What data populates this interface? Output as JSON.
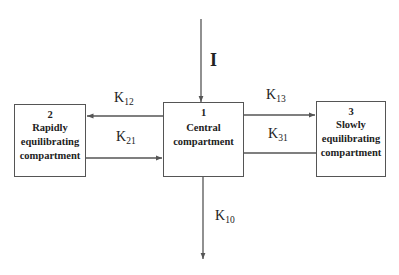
{
  "diagram": {
    "type": "three-compartment pharmacokinetic model",
    "input": {
      "label": "I"
    },
    "compartments": [
      {
        "id": "2",
        "number": "2",
        "lines": [
          "Rapidly",
          "equilibrating",
          "compartment"
        ]
      },
      {
        "id": "1",
        "number": "1",
        "lines": [
          "Central",
          "compartment"
        ]
      },
      {
        "id": "3",
        "number": "3",
        "lines": [
          "Slowly",
          "equilibrating",
          "compartment"
        ]
      }
    ],
    "rate_constants": {
      "k12": {
        "base": "K",
        "sub": "12"
      },
      "k21": {
        "base": "K",
        "sub": "21"
      },
      "k13": {
        "base": "K",
        "sub": "13"
      },
      "k31": {
        "base": "K",
        "sub": "31"
      },
      "k10": {
        "base": "K",
        "sub": "10"
      }
    },
    "colors": {
      "line": "#555555",
      "text": "#222222",
      "background": "#ffffff"
    }
  }
}
